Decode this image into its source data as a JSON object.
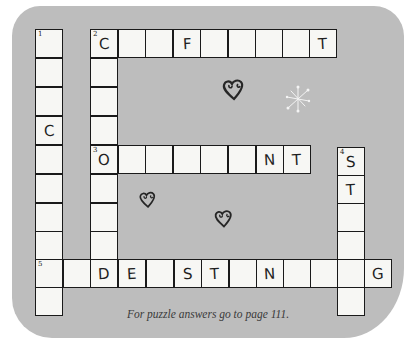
{
  "puzzle": {
    "caption": "For puzzle answers go to page 111.",
    "colors": {
      "background": "#bdbdbd",
      "cell_fill": "#f7f7f4",
      "grid_line": "#1a1a1a",
      "letter": "#1f1f1f"
    },
    "entries": [
      {
        "number": "1",
        "direction": "down",
        "length": 10,
        "letters": [
          "",
          "",
          "",
          "C",
          "",
          "",
          "",
          "",
          "",
          ""
        ]
      },
      {
        "number": "2",
        "direction": "across",
        "length": 9,
        "letters": [
          "C",
          "",
          "",
          "F",
          "",
          "",
          "",
          "",
          "T"
        ]
      },
      {
        "number": "2",
        "direction": "down",
        "length": 9,
        "letters": [
          "C",
          "",
          "",
          "",
          "O",
          "",
          "",
          "",
          "D"
        ]
      },
      {
        "number": "3",
        "direction": "across",
        "length": 8,
        "letters": [
          "O",
          "",
          "",
          "",
          "",
          "",
          "N",
          "T"
        ]
      },
      {
        "number": "4",
        "direction": "down",
        "length": 6,
        "letters": [
          "S",
          "T",
          "",
          "",
          "",
          ""
        ]
      },
      {
        "number": "5",
        "direction": "across",
        "length": 13,
        "letters": [
          "",
          "",
          "D",
          "E",
          "",
          "S",
          "T",
          "",
          "N",
          "",
          "",
          "",
          "G"
        ]
      }
    ],
    "decorations": [
      "heart-icon",
      "heart-icon",
      "heart-icon",
      "starburst-icon"
    ]
  },
  "cells": [
    {
      "x": 35,
      "y": 29,
      "letter": "",
      "num": "1"
    },
    {
      "x": 35,
      "y": 58,
      "letter": "",
      "num": ""
    },
    {
      "x": 35,
      "y": 87,
      "letter": "",
      "num": ""
    },
    {
      "x": 35,
      "y": 116,
      "letter": "C",
      "num": ""
    },
    {
      "x": 35,
      "y": 145,
      "letter": "",
      "num": ""
    },
    {
      "x": 35,
      "y": 174,
      "letter": "",
      "num": ""
    },
    {
      "x": 35,
      "y": 203,
      "letter": "",
      "num": ""
    },
    {
      "x": 35,
      "y": 231,
      "letter": "",
      "num": ""
    },
    {
      "x": 35,
      "y": 259,
      "letter": "",
      "num": "5"
    },
    {
      "x": 35,
      "y": 287,
      "letter": "",
      "num": ""
    },
    {
      "x": 90,
      "y": 29,
      "letter": "C",
      "num": "2"
    },
    {
      "x": 90,
      "y": 58,
      "letter": "",
      "num": ""
    },
    {
      "x": 90,
      "y": 87,
      "letter": "",
      "num": ""
    },
    {
      "x": 90,
      "y": 116,
      "letter": "",
      "num": ""
    },
    {
      "x": 90,
      "y": 145,
      "letter": "O",
      "num": "3"
    },
    {
      "x": 90,
      "y": 174,
      "letter": "",
      "num": ""
    },
    {
      "x": 90,
      "y": 203,
      "letter": "",
      "num": ""
    },
    {
      "x": 90,
      "y": 231,
      "letter": "",
      "num": ""
    },
    {
      "x": 90,
      "y": 259,
      "letter": "D",
      "num": ""
    },
    {
      "x": 118,
      "y": 29,
      "letter": "",
      "num": ""
    },
    {
      "x": 145,
      "y": 29,
      "letter": "",
      "num": ""
    },
    {
      "x": 173,
      "y": 29,
      "letter": "F",
      "num": ""
    },
    {
      "x": 200,
      "y": 29,
      "letter": "",
      "num": ""
    },
    {
      "x": 228,
      "y": 29,
      "letter": "",
      "num": ""
    },
    {
      "x": 255,
      "y": 29,
      "letter": "",
      "num": ""
    },
    {
      "x": 282,
      "y": 29,
      "letter": "",
      "num": ""
    },
    {
      "x": 309,
      "y": 29,
      "letter": "T",
      "num": ""
    },
    {
      "x": 118,
      "y": 145,
      "letter": "",
      "num": ""
    },
    {
      "x": 145,
      "y": 145,
      "letter": "",
      "num": ""
    },
    {
      "x": 173,
      "y": 145,
      "letter": "",
      "num": ""
    },
    {
      "x": 200,
      "y": 145,
      "letter": "",
      "num": ""
    },
    {
      "x": 228,
      "y": 145,
      "letter": "",
      "num": ""
    },
    {
      "x": 256,
      "y": 145,
      "letter": "N",
      "num": ""
    },
    {
      "x": 283,
      "y": 145,
      "letter": "T",
      "num": ""
    },
    {
      "x": 337,
      "y": 147,
      "letter": "S",
      "num": "4"
    },
    {
      "x": 337,
      "y": 175,
      "letter": "T",
      "num": ""
    },
    {
      "x": 337,
      "y": 203,
      "letter": "",
      "num": ""
    },
    {
      "x": 337,
      "y": 231,
      "letter": "",
      "num": ""
    },
    {
      "x": 337,
      "y": 259,
      "letter": "",
      "num": ""
    },
    {
      "x": 337,
      "y": 287,
      "letter": "",
      "num": ""
    },
    {
      "x": 63,
      "y": 259,
      "letter": "",
      "num": ""
    },
    {
      "x": 118,
      "y": 259,
      "letter": "E",
      "num": ""
    },
    {
      "x": 146,
      "y": 259,
      "letter": "",
      "num": ""
    },
    {
      "x": 174,
      "y": 259,
      "letter": "S",
      "num": ""
    },
    {
      "x": 201,
      "y": 259,
      "letter": "T",
      "num": ""
    },
    {
      "x": 229,
      "y": 259,
      "letter": "",
      "num": ""
    },
    {
      "x": 256,
      "y": 259,
      "letter": "N",
      "num": ""
    },
    {
      "x": 283,
      "y": 259,
      "letter": "",
      "num": ""
    },
    {
      "x": 310,
      "y": 259,
      "letter": "",
      "num": ""
    },
    {
      "x": 364,
      "y": 259,
      "letter": "G",
      "num": ""
    }
  ]
}
